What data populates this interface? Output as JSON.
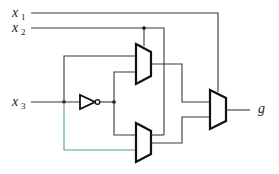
{
  "diagram": {
    "type": "logic-circuit",
    "inputs": [
      {
        "name": "x",
        "subscript": "1"
      },
      {
        "name": "x",
        "subscript": "2"
      },
      {
        "name": "x",
        "subscript": "3"
      }
    ],
    "output": {
      "name": "g"
    },
    "components": [
      {
        "id": "mux1",
        "kind": "2-to-1 multiplexer",
        "select": "x2"
      },
      {
        "id": "mux2",
        "kind": "2-to-1 multiplexer",
        "select": "x2"
      },
      {
        "id": "mux3",
        "kind": "2-to-1 multiplexer",
        "select": "x1"
      },
      {
        "id": "inv1",
        "kind": "NOT gate",
        "input": "x3"
      }
    ]
  }
}
